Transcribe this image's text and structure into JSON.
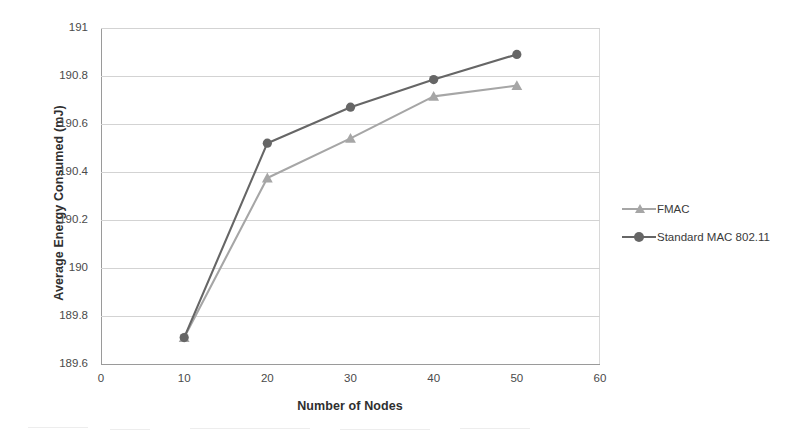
{
  "chart_data": {
    "type": "line",
    "title": "",
    "xlabel": "Number of Nodes",
    "ylabel": "Average Energy Consumed (mJ)",
    "x": [
      10,
      20,
      30,
      40,
      50
    ],
    "xlim": [
      0,
      60
    ],
    "ylim": [
      189.6,
      191
    ],
    "xticks": [
      "0",
      "10",
      "20",
      "30",
      "40",
      "50",
      "60"
    ],
    "yticks": [
      "189.6",
      "189.8",
      "190",
      "190.2",
      "190.4",
      "190.6",
      "190.8",
      "191"
    ],
    "grid": "horizontal",
    "legend_position": "right",
    "series": [
      {
        "name": "FMAC",
        "color": "#a6a6a6",
        "marker": "triangle",
        "values": [
          189.71,
          190.375,
          190.54,
          190.715,
          190.76
        ]
      },
      {
        "name": "Standard MAC 802.11",
        "color": "#666666",
        "marker": "circle",
        "values": [
          189.71,
          190.52,
          190.67,
          190.785,
          190.89
        ]
      }
    ]
  },
  "legend": {
    "items": [
      {
        "label": "FMAC"
      },
      {
        "label": "Standard MAC 802.11"
      }
    ]
  },
  "axes": {
    "x_title": "Number of Nodes",
    "y_title": "Average Energy Consumed (mJ)"
  }
}
